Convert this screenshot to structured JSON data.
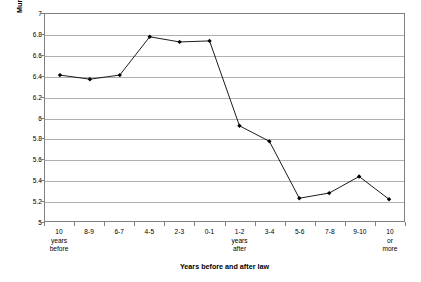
{
  "chart_data": {
    "type": "line",
    "title": "",
    "xlabel": "Years before and after law",
    "ylabel": "Murder rate per 100,000 people",
    "categories": [
      "10 years before",
      "8-9",
      "6-7",
      "4-5",
      "2-3",
      "0-1",
      "1-2 years after",
      "3-4",
      "5-6",
      "7-8",
      "9-10",
      "10 or more"
    ],
    "category_lines": [
      [
        "10",
        "years",
        "before"
      ],
      [
        "8-9"
      ],
      [
        "6-7"
      ],
      [
        "4-5"
      ],
      [
        "2-3"
      ],
      [
        "0-1"
      ],
      [
        "1-2",
        "years",
        "after"
      ],
      [
        "3-4"
      ],
      [
        "5-6"
      ],
      [
        "7-8"
      ],
      [
        "9-10"
      ],
      [
        "10",
        "or",
        "more"
      ]
    ],
    "values": [
      6.41,
      6.37,
      6.41,
      6.78,
      6.73,
      6.74,
      5.92,
      5.77,
      5.22,
      5.27,
      5.43,
      5.21
    ],
    "ylim": [
      5,
      7
    ],
    "ytick_step": 0.2,
    "ytick_labels": [
      "7",
      "6.8",
      "6.6",
      "6.4",
      "6.2",
      "6",
      "5.8",
      "5.6",
      "5.4",
      "5.2",
      "5"
    ],
    "ytick_values": [
      7,
      6.8,
      6.6,
      6.4,
      6.2,
      6,
      5.8,
      5.6,
      5.4,
      5.2,
      5
    ],
    "grid": "horizontal",
    "legend": "none",
    "series_color": "#000000",
    "gridline_color": "#b0b0b0",
    "frame_color": "#808080",
    "marker": "diamond"
  }
}
